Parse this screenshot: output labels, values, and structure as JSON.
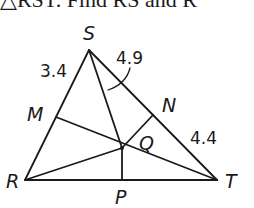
{
  "header": {
    "text": "△RST. Find RS and R"
  },
  "diagram": {
    "stroke_color": "#1a1a1a",
    "vertices": {
      "S": {
        "label": "S",
        "x": 89,
        "y": 50
      },
      "R": {
        "label": "R",
        "x": 25,
        "y": 180
      },
      "T": {
        "label": "T",
        "x": 217,
        "y": 180
      },
      "M": {
        "label": "M",
        "x": 56,
        "y": 117
      },
      "N": {
        "label": "N",
        "x": 153,
        "y": 115
      },
      "Q": {
        "label": "Q",
        "x": 122,
        "y": 148
      },
      "P": {
        "label": "P",
        "x": 122,
        "y": 180
      }
    },
    "measurements": {
      "SM": "3.4",
      "SQ": "4.9",
      "NT": "4.4"
    },
    "labels": {
      "S": "S",
      "R": "R",
      "T": "T",
      "M": "M",
      "N": "N",
      "Q": "Q",
      "P": "P",
      "len_SM": "3.4",
      "len_SQ": "4.9",
      "len_NT": "4.4"
    }
  }
}
